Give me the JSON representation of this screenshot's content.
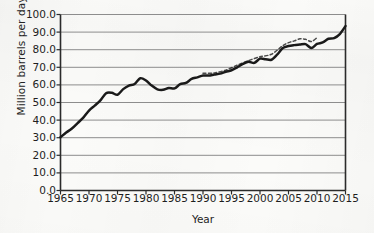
{
  "chart_data": {
    "type": "line",
    "title": "",
    "subtitle": "",
    "xlabel": "Year",
    "ylabel": "Million barrels per day",
    "xlim": [
      1965,
      2015
    ],
    "ylim": [
      0.0,
      100.0
    ],
    "xticks": [
      1965,
      1970,
      1975,
      1980,
      1985,
      1990,
      1995,
      2000,
      2005,
      2010,
      2015
    ],
    "xticklabels": [
      "1965",
      "1970",
      "1975",
      "1980",
      "1985",
      "1990",
      "1995",
      "2000",
      "2005",
      "2010",
      "2015"
    ],
    "yticks": [
      0.0,
      10.0,
      20.0,
      30.0,
      40.0,
      50.0,
      60.0,
      70.0,
      80.0,
      90.0,
      100.0
    ],
    "yticklabels": [
      "0.0",
      "10.0",
      "20.0",
      "30.0",
      "40.0",
      "50.0",
      "60.0",
      "70.0",
      "80.0",
      "90.0",
      "100.0"
    ],
    "grid": "horizontal",
    "legend": "none",
    "line_color": "#1a1a1a",
    "grid_color": "#8d8d8d",
    "axis_color": "#2b2b2b",
    "background_color": "#fbfbf9",
    "series": [
      {
        "name": "World oil production",
        "style": "solid",
        "x": [
          1965,
          1966,
          1967,
          1968,
          1969,
          1970,
          1971,
          1972,
          1973,
          1974,
          1975,
          1976,
          1977,
          1978,
          1979,
          1980,
          1981,
          1982,
          1983,
          1984,
          1985,
          1986,
          1987,
          1988,
          1989,
          1990,
          1991,
          1992,
          1993,
          1994,
          1995,
          1996,
          1997,
          1998,
          1999,
          2000,
          2001,
          2002,
          2003,
          2004,
          2005,
          2006,
          2007,
          2008,
          2009,
          2010,
          2011,
          2012,
          2013,
          2014,
          2015
        ],
        "values": [
          30.3,
          32.9,
          35.2,
          38.3,
          41.4,
          45.4,
          48.2,
          51.2,
          55.3,
          55.5,
          54.4,
          57.6,
          59.6,
          60.5,
          63.8,
          62.5,
          59.6,
          57.5,
          57.2,
          58.2,
          58.0,
          60.4,
          61.1,
          63.4,
          64.3,
          65.3,
          65.3,
          65.9,
          66.4,
          67.5,
          68.3,
          70.0,
          71.9,
          73.2,
          72.5,
          74.9,
          74.6,
          74.3,
          77.2,
          80.9,
          82.1,
          82.6,
          82.9,
          83.2,
          80.9,
          83.3,
          84.1,
          86.2,
          86.6,
          88.9,
          93.4
        ]
      },
      {
        "name": "World oil consumption",
        "style": "dashed",
        "x": [
          1990,
          1992,
          1994,
          1996,
          1998,
          2000,
          2002,
          2004,
          2005,
          2006,
          2007,
          2008,
          2009,
          2010
        ],
        "values": [
          66.6,
          66.8,
          68.4,
          71.2,
          73.8,
          76.0,
          77.4,
          82.3,
          84.0,
          85.0,
          86.2,
          85.9,
          84.6,
          86.8
        ]
      }
    ]
  },
  "axes": {
    "ylabel": "Million barrels per day",
    "xlabel": "Year"
  }
}
